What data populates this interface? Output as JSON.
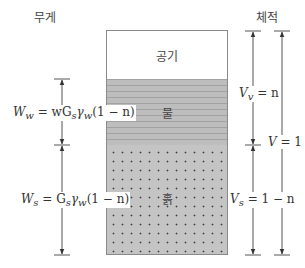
{
  "headers": {
    "weight": "무게",
    "volume": "체적"
  },
  "phases": [
    {
      "name": "air",
      "label": "공기",
      "fill": "#ffffff"
    },
    {
      "name": "water",
      "label": "물",
      "fill": "#bdbdbd"
    },
    {
      "name": "soil",
      "label": "흙",
      "fill": "#c4c4c4"
    }
  ],
  "weights": {
    "water": {
      "lhs": "W",
      "sub": "w",
      "rhs": "= wG",
      "rhs_sub": "s",
      "gamma": "γ",
      "gamma_sub": "w",
      "tail": "(1 − n)"
    },
    "solids": {
      "lhs": "W",
      "sub": "s",
      "rhs": "= G",
      "rhs_sub": "s",
      "gamma": "γ",
      "gamma_sub": "w",
      "tail": "(1 − n)"
    }
  },
  "volumes": {
    "voids": {
      "lhs": "V",
      "sub": "v",
      "rhs": "= n"
    },
    "solids": {
      "lhs": "V",
      "sub": "s",
      "rhs": "= 1 − n"
    },
    "total": {
      "lhs": "V",
      "rhs": "= 1"
    }
  },
  "colors": {
    "line": "#555555",
    "border": "#8a8a8a"
  }
}
